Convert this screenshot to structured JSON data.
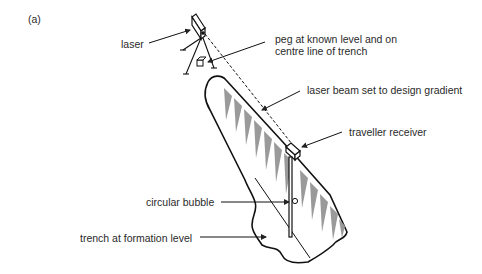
{
  "figure": {
    "panel_label": "(a)",
    "labels": {
      "laser": "laser",
      "peg_line1": "peg at known level and on",
      "peg_line2": "centre line of trench",
      "beam": "laser beam set to design gradient",
      "receiver": "traveller receiver",
      "bubble": "circular bubble",
      "trench": "trench at formation level"
    }
  }
}
